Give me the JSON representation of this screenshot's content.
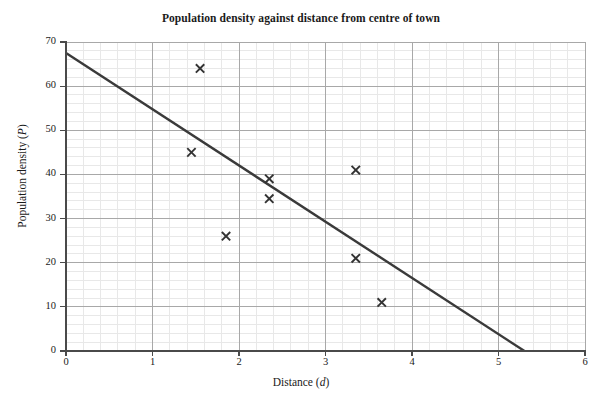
{
  "chart_data": {
    "type": "scatter",
    "title": "Population density against distance from centre of town",
    "xlabel": "Distance (d)",
    "xlabel_text": "Distance",
    "xlabel_var": "d",
    "ylabel": "Population density (P)",
    "ylabel_text": "Population density",
    "ylabel_var": "P",
    "xlim": [
      0,
      6
    ],
    "ylim": [
      0,
      70
    ],
    "xticks": [
      0,
      1,
      2,
      3,
      4,
      5,
      6
    ],
    "yticks": [
      0,
      10,
      20,
      30,
      40,
      50,
      60,
      70
    ],
    "x_major_step": 1,
    "y_major_step": 10,
    "x_minor_step": 0.2,
    "y_minor_step": 2,
    "grid": true,
    "grid_major_color": "#a8a8a8",
    "grid_minor_color": "#e8e8e8",
    "legend": "none",
    "marker": "x",
    "marker_color": "#333333",
    "points": [
      {
        "x": 1.55,
        "y": 64.0
      },
      {
        "x": 1.45,
        "y": 45.0
      },
      {
        "x": 1.85,
        "y": 26.0
      },
      {
        "x": 2.35,
        "y": 39.0
      },
      {
        "x": 2.35,
        "y": 34.5
      },
      {
        "x": 3.35,
        "y": 41.0
      },
      {
        "x": 3.35,
        "y": 21.0
      },
      {
        "x": 3.65,
        "y": 11.0
      }
    ],
    "trendline": {
      "label": "line of best fit",
      "x_start": 0,
      "y_start": 67.5,
      "x_end": 5.3,
      "y_end": 0,
      "color": "#3a3a3a",
      "width": 2.4
    }
  }
}
